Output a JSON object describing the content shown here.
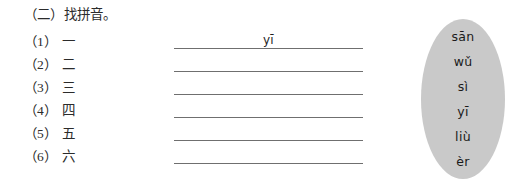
{
  "worksheet": {
    "heading": "（二）找拼音。",
    "questions": [
      {
        "number": "（1）",
        "character": "一",
        "answer": "yī"
      },
      {
        "number": "（2）",
        "character": "二",
        "answer": ""
      },
      {
        "number": "（3）",
        "character": "三",
        "answer": ""
      },
      {
        "number": "（4）",
        "character": "四",
        "answer": ""
      },
      {
        "number": "（5）",
        "character": "五",
        "answer": ""
      },
      {
        "number": "（6）",
        "character": "六",
        "answer": ""
      }
    ],
    "word_bank": {
      "shape": "oval",
      "fill_color": "#c9c9c9",
      "items": [
        "sān",
        "wǔ",
        "sì",
        "yī",
        "liù",
        "èr"
      ]
    },
    "colors": {
      "text": "#2b2b2b",
      "rule_line": "#6f6f6f",
      "background": "#ffffff"
    }
  }
}
